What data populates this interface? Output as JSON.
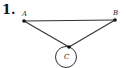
{
  "problem": {
    "number": "1."
  },
  "diagram": {
    "nodes": [
      {
        "id": "A",
        "label": "A",
        "x": 24,
        "y": 21
      },
      {
        "id": "B",
        "label": "B",
        "x": 115,
        "y": 20
      },
      {
        "id": "C",
        "label": "C",
        "x": 69,
        "y": 47
      }
    ],
    "edges": [
      {
        "from": "A",
        "to": "B"
      },
      {
        "from": "A",
        "to": "C"
      },
      {
        "from": "B",
        "to": "C"
      }
    ],
    "loop": {
      "node": "C",
      "cx": 66,
      "cy": 57,
      "r": 11
    }
  },
  "colors": {
    "ink": "#222222",
    "background": "#ffffff"
  }
}
